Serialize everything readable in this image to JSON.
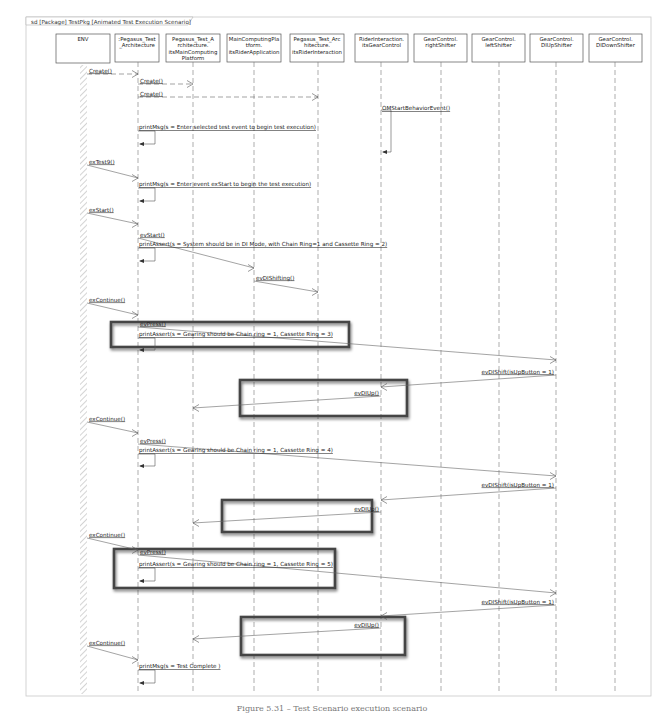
{
  "frame": {
    "title": "sd [Package] TestPkg [Animated Test Execution Scenario]"
  },
  "lifelines": [
    {
      "id": "env",
      "lines": [
        "ENV"
      ],
      "x": 83,
      "box": [
        56,
        110
      ],
      "actor": true
    },
    {
      "id": "arch",
      "lines": [
        ":Pegasus_Test",
        "_Architecture"
      ],
      "x": 138,
      "box": [
        115,
        159
      ]
    },
    {
      "id": "mcp",
      "lines": [
        "Pegasus_Test_A",
        "rchitecture.",
        "itsMainComputing",
        "Platform"
      ],
      "x": 193,
      "box": [
        166,
        220
      ]
    },
    {
      "id": "riderapp",
      "lines": [
        "MainComputingPla",
        "tform.",
        "itsRiderApplication"
      ],
      "x": 254,
      "box": [
        227,
        281
      ]
    },
    {
      "id": "riderint",
      "lines": [
        "Pegasus_Test_Arc",
        "hitecture.",
        "itsRiderInteraction"
      ],
      "x": 318,
      "box": [
        290,
        344
      ]
    },
    {
      "id": "gearctrl",
      "lines": [
        "RiderInteraction.",
        "itsGearControl"
      ],
      "x": 381,
      "box": [
        355,
        408
      ]
    },
    {
      "id": "right",
      "lines": [
        "GearControl.",
        "rightShifter"
      ],
      "x": 441,
      "box": [
        414,
        467
      ]
    },
    {
      "id": "left",
      "lines": [
        "GearControl.",
        "leftShifter"
      ],
      "x": 499,
      "box": [
        472,
        525
      ]
    },
    {
      "id": "diup",
      "lines": [
        "GearControl.",
        "DIUpShifter"
      ],
      "x": 556,
      "box": [
        530,
        583
      ]
    },
    {
      "id": "didown",
      "lines": [
        "GearControl.",
        "DIDownShifter"
      ],
      "x": 615,
      "box": [
        589,
        642
      ]
    }
  ],
  "messages": [
    {
      "label": "Create()",
      "from": "env",
      "to": "arch",
      "y1": 74,
      "y2": 74,
      "kind": "create"
    },
    {
      "label": "Create()",
      "from": "arch",
      "to": "mcp",
      "y1": 84,
      "y2": 84,
      "kind": "create"
    },
    {
      "label": "Create()",
      "from": "arch",
      "to": "riderint",
      "y1": 97,
      "y2": 97,
      "kind": "create"
    },
    {
      "label": "OMStartBehaviorEvent()",
      "from": "gearctrl",
      "to": "gearctrl",
      "y1": 110,
      "y2": 152,
      "kind": "self",
      "w": 10
    },
    {
      "label": "printMsg(s = Enter selected test event to begin test execution)",
      "from": "arch",
      "to": "arch",
      "y1": 129,
      "y2": 144,
      "kind": "self",
      "w": 17
    },
    {
      "label": "exTest9()",
      "from": "env",
      "to": "arch",
      "y1": 165,
      "y2": 178,
      "kind": "signal"
    },
    {
      "label": "printMsg(s = Enter event exStart to begin the test execution)",
      "from": "arch",
      "to": "arch",
      "y1": 186,
      "y2": 201,
      "kind": "self",
      "w": 17
    },
    {
      "label": "exStart()",
      "from": "env",
      "to": "arch",
      "y1": 213,
      "y2": 224,
      "kind": "signal"
    },
    {
      "label": "evStart()",
      "from": "arch",
      "to": "riderapp",
      "y1": 238,
      "y2": 268,
      "kind": "signal"
    },
    {
      "label": "printAssert(s = System should be in DI Mode, with Chain Ring=1 and Cassette Ring = 2)",
      "from": "arch",
      "to": "arch",
      "y1": 246,
      "y2": 261,
      "kind": "self",
      "w": 17
    },
    {
      "label": "evDIShifting()",
      "from": "riderapp",
      "to": "riderint",
      "y1": 281,
      "y2": 292,
      "kind": "signal"
    },
    {
      "label": "exContinue()",
      "from": "env",
      "to": "arch",
      "y1": 303,
      "y2": 315,
      "kind": "signal"
    },
    {
      "label": "evPress()",
      "from": "arch",
      "to": "diup",
      "y1": 327,
      "y2": 360,
      "kind": "signal"
    },
    {
      "label": "printAssert(s = Gearing should be Chain ring = 1, Cassette Ring = 3)",
      "from": "arch",
      "to": "arch",
      "y1": 336,
      "y2": 350,
      "kind": "self",
      "w": 17
    },
    {
      "label": "evDIShift(isUpButton = 1)",
      "from": "diup",
      "to": "gearctrl",
      "y1": 375,
      "y2": 387,
      "kind": "signal"
    },
    {
      "label": "evDIUp()",
      "from": "gearctrl",
      "to": "mcp",
      "y1": 396,
      "y2": 408,
      "kind": "signal"
    },
    {
      "label": "exContinue()",
      "from": "env",
      "to": "arch",
      "y1": 422,
      "y2": 433,
      "kind": "signal"
    },
    {
      "label": "evPress()",
      "from": "arch",
      "to": "diup",
      "y1": 444,
      "y2": 476,
      "kind": "signal"
    },
    {
      "label": "printAssert(s = Gearing should be Chain ring = 1, Cassette Ring = 4)",
      "from": "arch",
      "to": "arch",
      "y1": 452,
      "y2": 466,
      "kind": "self",
      "w": 17
    },
    {
      "label": "evDIShift(isUpButton = 1)",
      "from": "diup",
      "to": "gearctrl",
      "y1": 488,
      "y2": 500,
      "kind": "signal"
    },
    {
      "label": "evDIUp()",
      "from": "gearctrl",
      "to": "mcp",
      "y1": 512,
      "y2": 523,
      "kind": "signal"
    },
    {
      "label": "exContinue()",
      "from": "env",
      "to": "arch",
      "y1": 538,
      "y2": 550,
      "kind": "signal"
    },
    {
      "label": "evPress()",
      "from": "arch",
      "to": "diup",
      "y1": 555,
      "y2": 593,
      "kind": "signal"
    },
    {
      "label": "printAssert(s = Gearing should be Chain ring = 1, Cassette Ring = 5)",
      "from": "arch",
      "to": "arch",
      "y1": 566,
      "y2": 581,
      "kind": "self",
      "w": 17
    },
    {
      "label": "evDIShift(isUpButton = 1)",
      "from": "diup",
      "to": "gearctrl",
      "y1": 605,
      "y2": 616,
      "kind": "signal"
    },
    {
      "label": "evDIUp()",
      "from": "gearctrl",
      "to": "mcp",
      "y1": 628,
      "y2": 639,
      "kind": "signal"
    },
    {
      "label": "exContinue()",
      "from": "env",
      "to": "arch",
      "y1": 646,
      "y2": 660,
      "kind": "signal"
    },
    {
      "label": "printMsg(s = Test Complete )",
      "from": "arch",
      "to": "arch",
      "y1": 668,
      "y2": 683,
      "kind": "self",
      "w": 17
    }
  ],
  "highlights": [
    {
      "x": 111,
      "y": 322,
      "w": 238,
      "h": 25
    },
    {
      "x": 240,
      "y": 380,
      "w": 167,
      "h": 36
    },
    {
      "x": 222,
      "y": 500,
      "w": 150,
      "h": 32
    },
    {
      "x": 114,
      "y": 549,
      "w": 221,
      "h": 39
    },
    {
      "x": 241,
      "y": 617,
      "w": 164,
      "h": 38
    }
  ],
  "caption": "Figure 5.31 – Test Scenario execution scenario"
}
